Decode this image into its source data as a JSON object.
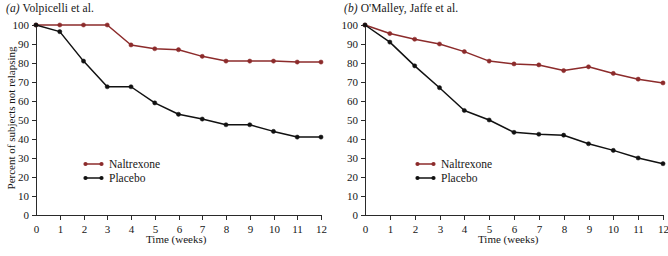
{
  "figure": {
    "panels": [
      {
        "id": "a",
        "tag": "(a)",
        "title": "Volpicelli et al.",
        "xlabel": "Time (weeks)",
        "ylabel": "Percent of subjects not relapsing"
      },
      {
        "id": "b",
        "tag": "(b)",
        "title": "O'Malley, Jaffe et al.",
        "xlabel": "Time (weeks)",
        "ylabel": "Percent of subjects not relapsing"
      }
    ]
  },
  "legend": {
    "naltrexone_label": "Naltrexone",
    "placebo_label": "Placebo"
  },
  "colors": {
    "naltrexone": "#8c2b2b",
    "placebo": "#111111",
    "axis": "#2a2a2a",
    "text": "#161616",
    "background": "#ffffff"
  },
  "chart_data": [
    {
      "type": "line",
      "panel": "a",
      "title": "(a) Volpicelli et al.",
      "xlabel": "Time (weeks)",
      "ylabel": "Percent of subjects not relapsing",
      "xlim": [
        0,
        12
      ],
      "ylim": [
        0,
        100
      ],
      "xticks": [
        0,
        1,
        2,
        3,
        4,
        5,
        6,
        7,
        8,
        9,
        10,
        11,
        12
      ],
      "xticklabels": [
        "0",
        "1",
        "2",
        "3",
        "4",
        "5",
        "6",
        "7",
        "8",
        "9",
        "10",
        "11",
        "12"
      ],
      "yticks": [
        0,
        10,
        20,
        30,
        40,
        50,
        60,
        70,
        80,
        90,
        100
      ],
      "yticklabels": [
        "0",
        "10",
        "20",
        "30",
        "40",
        "50",
        "60",
        "70",
        "80",
        "90",
        "100"
      ],
      "grid": false,
      "legend_position": "lower-left-inside",
      "x": [
        0,
        1,
        2,
        3,
        4,
        5,
        6,
        7,
        8,
        9,
        10,
        11,
        12
      ],
      "series": [
        {
          "name": "Naltrexone",
          "color": "#8c2b2b",
          "values": [
            100,
            100,
            100,
            100,
            89.5,
            87.5,
            87,
            83.5,
            81,
            81,
            81,
            80.5,
            80.5
          ]
        },
        {
          "name": "Placebo",
          "color": "#111111",
          "values": [
            100,
            96.5,
            81,
            67.5,
            67.5,
            59,
            53,
            50.5,
            47.5,
            47.5,
            44,
            41,
            41
          ]
        }
      ]
    },
    {
      "type": "line",
      "panel": "b",
      "title": "(b) O'Malley, Jaffe et al.",
      "xlabel": "Time (weeks)",
      "ylabel": "Percent of subjects not relapsing",
      "xlim": [
        0,
        12
      ],
      "ylim": [
        0,
        100
      ],
      "xticks": [
        0,
        1,
        2,
        3,
        4,
        5,
        6,
        7,
        8,
        9,
        10,
        11,
        12
      ],
      "xticklabels": [
        "0",
        "1",
        "2",
        "3",
        "4",
        "5",
        "6",
        "7",
        "8",
        "9",
        "10",
        "11",
        "12"
      ],
      "yticks": [
        0,
        10,
        20,
        30,
        40,
        50,
        60,
        70,
        80,
        90,
        100
      ],
      "yticklabels": [
        "0",
        "10",
        "20",
        "30",
        "40",
        "50",
        "60",
        "70",
        "80",
        "90",
        "100"
      ],
      "grid": false,
      "legend_position": "lower-left-inside",
      "x": [
        0,
        1,
        2,
        3,
        4,
        5,
        6,
        7,
        8,
        9,
        10,
        11,
        12
      ],
      "series": [
        {
          "name": "Naltrexone",
          "color": "#8c2b2b",
          "values": [
            100,
            95.5,
            92.5,
            90,
            86,
            81,
            79.5,
            79,
            76,
            78,
            74.5,
            71.5,
            69.5
          ]
        },
        {
          "name": "Placebo",
          "color": "#111111",
          "values": [
            100,
            91,
            78.5,
            67,
            55,
            50,
            43.5,
            42.5,
            42,
            37.5,
            34,
            30,
            27
          ]
        }
      ]
    }
  ]
}
